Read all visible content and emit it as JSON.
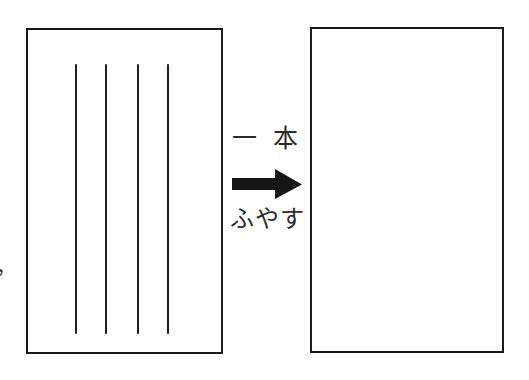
{
  "figure": {
    "type": "instructional-diagram",
    "background_color": "#ffffff",
    "ink_color": "#1a1a1a",
    "width": 529,
    "height": 380
  },
  "panels": {
    "before": {
      "name": "before-panel",
      "stroke_count": 4,
      "strokes": [
        {
          "x": 47,
          "top": 34,
          "height": 270
        },
        {
          "x": 77,
          "top": 34,
          "height": 270
        },
        {
          "x": 109,
          "top": 34,
          "height": 270
        },
        {
          "x": 139,
          "top": 34,
          "height": 270
        }
      ]
    },
    "after": {
      "name": "after-panel",
      "stroke_count": 0,
      "strokes": []
    }
  },
  "annotation": {
    "top_label": "一 本",
    "bottom_label": "ふやす",
    "arrow_direction": "right",
    "arrow_color": "#161616"
  },
  "margin": {
    "fragment": "，"
  }
}
